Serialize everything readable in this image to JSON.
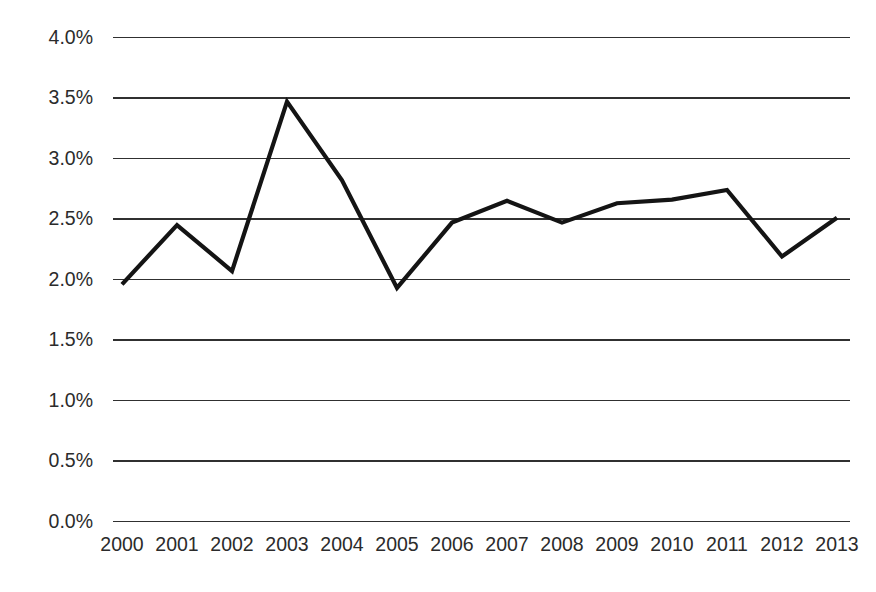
{
  "chart_data": {
    "type": "line",
    "title": "",
    "subtitle": "",
    "xlabel": "",
    "ylabel": "",
    "categories": [
      "2000",
      "2001",
      "2002",
      "2003",
      "2004",
      "2005",
      "2006",
      "2007",
      "2008",
      "2009",
      "2010",
      "2011",
      "2012",
      "2013"
    ],
    "x": [
      2000,
      2001,
      2002,
      2003,
      2004,
      2005,
      2006,
      2007,
      2008,
      2009,
      2010,
      2011,
      2012,
      2013
    ],
    "values": [
      1.96,
      2.45,
      2.07,
      3.47,
      2.82,
      1.93,
      2.47,
      2.65,
      2.47,
      2.63,
      2.66,
      2.74,
      2.19,
      2.51
    ],
    "series": [
      {
        "name": "",
        "values": [
          1.96,
          2.45,
          2.07,
          3.47,
          2.82,
          1.93,
          2.47,
          2.65,
          2.47,
          2.63,
          2.66,
          2.74,
          2.19,
          2.51
        ],
        "color": "#141414"
      }
    ],
    "ylim": [
      0.0,
      4.0
    ],
    "y_ticks": [
      0.0,
      0.5,
      1.0,
      1.5,
      2.0,
      2.5,
      3.0,
      3.5,
      4.0
    ],
    "y_tick_labels": [
      "0.0%",
      "0.5%",
      "1.0%",
      "1.5%",
      "2.0%",
      "2.5%",
      "3.0%",
      "3.5%",
      "4.0%"
    ],
    "y_unit": "%",
    "x_tick_labels": [
      "2000",
      "2001",
      "2002",
      "2003",
      "2004",
      "2005",
      "2006",
      "2007",
      "2008",
      "2009",
      "2010",
      "2011",
      "2012",
      "2013"
    ],
    "grid": {
      "horizontal": true,
      "vertical": false,
      "color": "#303030"
    },
    "legend": {
      "visible": false,
      "position": "none",
      "entries": []
    },
    "annotations": [],
    "colors": {
      "line": "#141414",
      "grid": "#303030",
      "text": "#2b2b2b",
      "background": "#ffffff"
    }
  }
}
